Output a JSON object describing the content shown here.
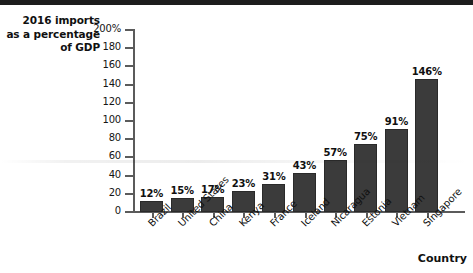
{
  "chart_data": {
    "type": "bar",
    "title": "2016 imports as a percentage of GDP",
    "title_lines": [
      "2016 imports",
      "as a percentage",
      "of GDP"
    ],
    "xlabel": "Country",
    "ylabel": "2016 imports as a percentage of GDP",
    "categories": [
      "Brazil",
      "United States",
      "China",
      "Kenya",
      "France",
      "Iceland",
      "Nicaragua",
      "Estonia",
      "Vietnam",
      "Singapore"
    ],
    "values": [
      12,
      15,
      17,
      23,
      31,
      43,
      57,
      75,
      91,
      146
    ],
    "value_labels": [
      "12%",
      "15%",
      "17%",
      "23%",
      "31%",
      "43%",
      "57%",
      "75%",
      "91%",
      "146%"
    ],
    "ylim": [
      0,
      200
    ],
    "ytick_values": [
      0,
      20,
      40,
      60,
      80,
      100,
      120,
      140,
      160,
      180,
      200
    ],
    "ytick_labels": [
      "0",
      "20",
      "40",
      "60",
      "80",
      "100",
      "120",
      "140",
      "160",
      "180",
      "200%"
    ],
    "grid": false,
    "legend": null,
    "bar_color": "#3b3b3b",
    "axis_color": "#5b5b5b",
    "text_color": "#101010",
    "background": "#ffffff"
  }
}
